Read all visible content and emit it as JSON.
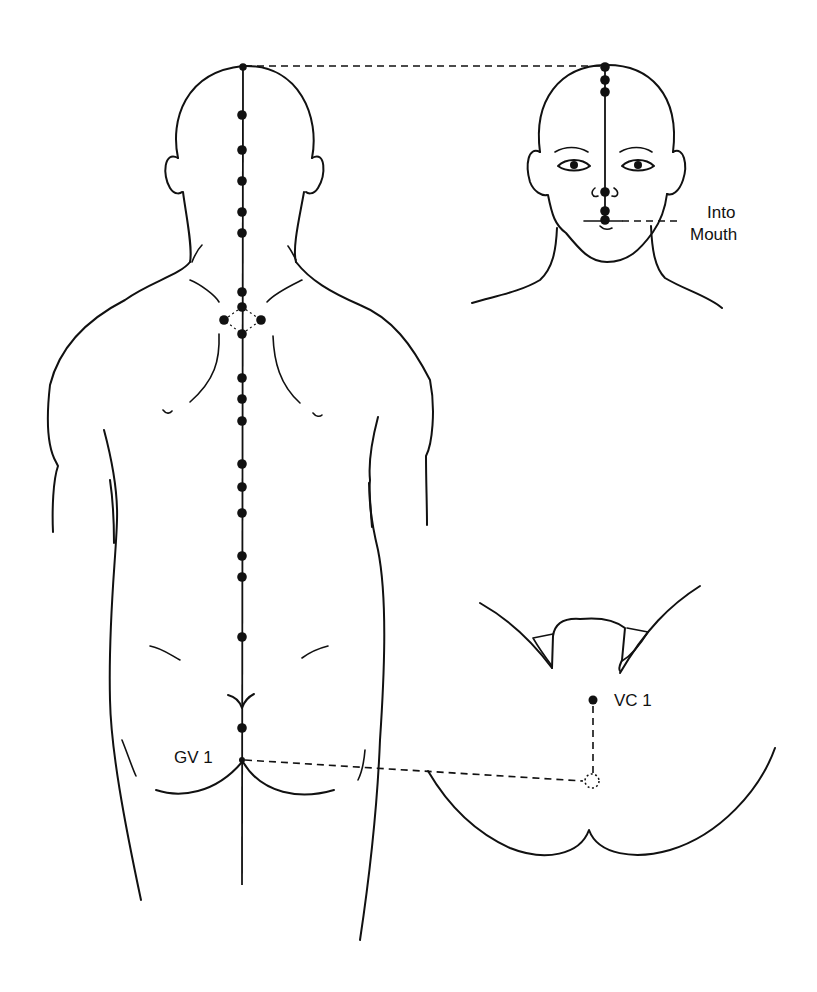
{
  "diagram": {
    "line_color": "#111111",
    "background": "#ffffff",
    "views": [
      {
        "id": "back-view",
        "description": "Posterior view of head, neck, back and buttocks with meridian points along the spine"
      },
      {
        "id": "face-view",
        "description": "Anterior view of face showing pathway over the head to the upper lip"
      },
      {
        "id": "perineum-view",
        "description": "Inferior view of the perineum showing VC 1 and the connection to GV 1"
      }
    ],
    "labels": {
      "into_mouth_line1": "Into",
      "into_mouth_line2": "Mouth",
      "gv1": "GV 1",
      "vc1": "VC 1"
    },
    "back_view_points_y": [
      67,
      115,
      150,
      181,
      212,
      233,
      292,
      307,
      334,
      378,
      399,
      421,
      464,
      487,
      513,
      556,
      577,
      637,
      728
    ],
    "side_points": [
      {
        "x": 224,
        "y": 320
      },
      {
        "x": 261,
        "y": 320
      }
    ],
    "face_view_points_y": [
      67,
      80,
      92,
      192,
      211,
      220
    ]
  }
}
